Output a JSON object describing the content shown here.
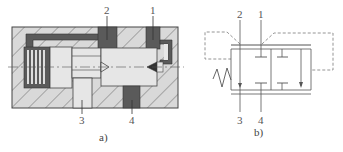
{
  "figure": {
    "panel_a": {
      "caption": "a)",
      "ports": {
        "p1": "1",
        "p2": "2",
        "p3": "3",
        "p4": "4"
      },
      "description": "Cross-section of a pneumatic pilot-operated valve with spring-returned spool"
    },
    "panel_b": {
      "caption": "b)",
      "ports": {
        "p1": "1",
        "p2": "2",
        "p3": "3",
        "p4": "4"
      },
      "description": "Graphical symbol of the valve with spring return and dashed pilot lines"
    }
  },
  "colors": {
    "body_fill": "#d9d9d9",
    "hatch": "#6e6e6e",
    "dark_channel": "#5a5a5a",
    "light_part": "#e6e6e6",
    "outline": "#444444",
    "symbol_line": "#555555",
    "pilot_dash": "#888888"
  }
}
